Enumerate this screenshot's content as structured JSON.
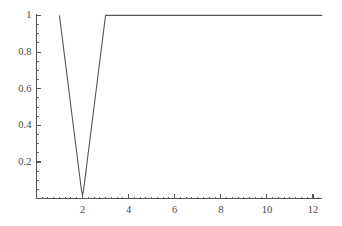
{
  "chart_data": {
    "type": "line",
    "title": "",
    "xlabel": "",
    "ylabel": "",
    "xlim": [
      0,
      12.4
    ],
    "ylim": [
      0,
      1.02
    ],
    "grid": false,
    "legend": null,
    "xticks": [
      2,
      4,
      6,
      8,
      10,
      12
    ],
    "xtick_labels": [
      "2",
      "4",
      "6",
      "8",
      "10",
      "12"
    ],
    "xminor_step": 0.25,
    "yticks": [
      0.2,
      0.4,
      0.6,
      0.8,
      1
    ],
    "ytick_labels": [
      "0.2",
      "0.4",
      "0.6",
      "0.8",
      "1"
    ],
    "yminor_step": 0.05,
    "line_color": "#555555",
    "axis_color": "#555555",
    "line_width": 1.1,
    "series": [
      {
        "name": "curve",
        "x": [
          1.0,
          1.1,
          1.2,
          1.3,
          1.4,
          1.5,
          1.6,
          1.7,
          1.8,
          1.9,
          1.95,
          2.0,
          2.05,
          2.1,
          2.2,
          2.3,
          2.4,
          2.5,
          2.6,
          2.7,
          2.8,
          2.9,
          3.0,
          3.5,
          4.0,
          5.0,
          6.0,
          7.0,
          8.0,
          9.0,
          10.0,
          11.0,
          12.0,
          12.4
        ],
        "y": [
          1.0,
          0.9,
          0.8,
          0.7,
          0.6,
          0.5,
          0.4,
          0.3,
          0.2,
          0.1,
          0.05,
          0.02,
          0.05,
          0.1,
          0.2,
          0.3,
          0.4,
          0.5,
          0.6,
          0.7,
          0.8,
          0.9,
          1.0,
          1.0,
          1.0,
          1.0,
          1.0,
          1.0,
          1.0,
          1.0,
          1.0,
          1.0,
          1.0,
          1.0
        ]
      }
    ],
    "annotations": []
  },
  "geometry": {
    "x0_px": 36.4,
    "y0_px": 198.7,
    "px_per_x": 23.05,
    "px_per_y": 183.3,
    "x_axis_end_px": 322,
    "y_axis_top_px": 14
  }
}
